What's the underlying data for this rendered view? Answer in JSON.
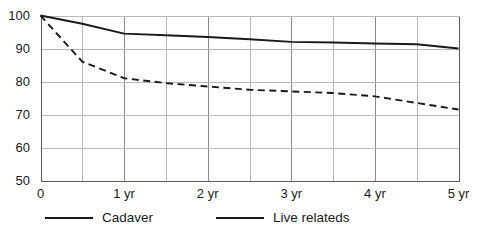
{
  "chart_data": {
    "type": "line",
    "title": "",
    "subtitle": "",
    "xlabel": "",
    "ylabel": "",
    "x": [
      0,
      0.5,
      1,
      1.5,
      2,
      2.5,
      3,
      3.5,
      4,
      4.5,
      5
    ],
    "xlim": [
      0,
      5
    ],
    "ylim": [
      50,
      100
    ],
    "grid": true,
    "grid_x_step": 0.5,
    "grid_y_step": 10,
    "legend_position": "bottom",
    "series": [
      {
        "name": "Cadaver",
        "style": "dashed",
        "color": "#1a1a1a",
        "values": [
          100,
          86,
          81,
          79.5,
          78.5,
          77.5,
          77,
          76.5,
          75.5,
          73.5,
          71.5
        ]
      },
      {
        "name": "Live relateds",
        "style": "solid",
        "color": "#1a1a1a",
        "values": [
          100,
          97.5,
          94.5,
          94,
          93.5,
          92.8,
          92,
          91.8,
          91.5,
          91.3,
          90
        ]
      }
    ],
    "ytick_labels": [
      "100",
      "90",
      "80",
      "70",
      "60",
      "50"
    ],
    "ytick_values": [
      100,
      90,
      80,
      70,
      60,
      50
    ],
    "xtick_labels": [
      "0",
      "1 yr",
      "2 yr",
      "3 yr",
      "4 yr",
      "5 yr"
    ],
    "xtick_values": [
      0,
      1,
      2,
      3,
      4,
      5
    ]
  },
  "legend": {
    "entries": [
      {
        "label": "Cadaver",
        "style": "dashed"
      },
      {
        "label": "Live relateds",
        "style": "solid"
      }
    ]
  },
  "colors": {
    "line": "#1a1a1a",
    "grid_minor": "#b9b9b9",
    "grid_major": "#8a8a8a",
    "axis": "#5a5a5a",
    "text": "#1a1a1a",
    "background": "#ffffff"
  }
}
